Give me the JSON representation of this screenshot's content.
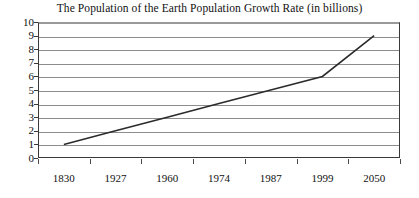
{
  "chart_data": {
    "type": "line",
    "title": "The Population of the Earth Population Growth Rate (in billions)",
    "xlabel": "",
    "ylabel": "",
    "categories": [
      "1830",
      "1927",
      "1960",
      "1974",
      "1987",
      "1999",
      "2050"
    ],
    "values": [
      1,
      2,
      3,
      4,
      5,
      6,
      9
    ],
    "series": [
      {
        "name": "World population (in billions)",
        "values": [
          1,
          2,
          3,
          4,
          5,
          6,
          9
        ]
      }
    ],
    "ylim": [
      0,
      10
    ],
    "yticks": [
      0,
      1,
      2,
      3,
      4,
      5,
      6,
      7,
      8,
      9,
      10
    ],
    "ytick_labels": [
      "0",
      "1",
      "2",
      "3",
      "4",
      "5",
      "6",
      "7",
      "8",
      "9",
      "10"
    ],
    "grid": "horizontal",
    "legend": "none",
    "line_color": "#2b2b2b",
    "grid_color": "#8d8d8d",
    "axis_color": "#3a3a3a",
    "background": "#ffffff",
    "annotations": []
  }
}
